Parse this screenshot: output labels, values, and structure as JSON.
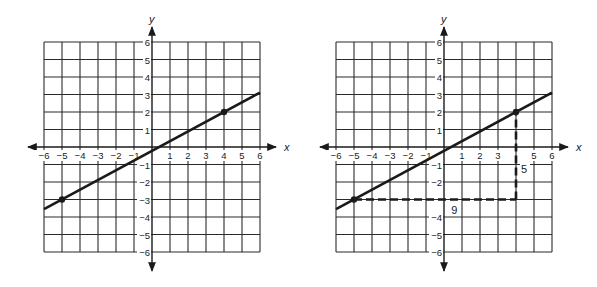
{
  "chart_data": [
    {
      "type": "line",
      "title": "",
      "xlabel": "x",
      "ylabel": "y",
      "xlim": [
        -6,
        6
      ],
      "ylim": [
        -6,
        6
      ],
      "grid": true,
      "x_ticks": [
        "-6",
        "-5",
        "-4",
        "-3",
        "-2",
        "-1",
        "1",
        "2",
        "3",
        "4",
        "5",
        "6"
      ],
      "y_ticks": [
        "6",
        "5",
        "4",
        "3",
        "2",
        "1",
        "-1",
        "-2",
        "-3",
        "-4",
        "-5",
        "-6"
      ],
      "series": [
        {
          "name": "line",
          "x": [
            -6,
            6
          ],
          "y": [
            -3.556,
            3.111
          ]
        }
      ],
      "points": [
        {
          "x": -5,
          "y": -3
        },
        {
          "x": 4,
          "y": 2
        }
      ],
      "slope": "5/9"
    },
    {
      "type": "line",
      "title": "",
      "xlabel": "x",
      "ylabel": "y",
      "xlim": [
        -6,
        6
      ],
      "ylim": [
        -6,
        6
      ],
      "grid": true,
      "x_ticks": [
        "-6",
        "-5",
        "-4",
        "-3",
        "-2",
        "-1",
        "1",
        "2",
        "3",
        "",
        "5",
        "6"
      ],
      "y_ticks": [
        "6",
        "5",
        "4",
        "3",
        "2",
        "1",
        "-1",
        "-2",
        "",
        "-4",
        "-5",
        "-6"
      ],
      "series": [
        {
          "name": "line",
          "x": [
            -6,
            6
          ],
          "y": [
            -3.556,
            3.111
          ]
        }
      ],
      "points": [
        {
          "x": -5,
          "y": -3
        },
        {
          "x": 4,
          "y": 2
        }
      ],
      "dashed_segments": [
        {
          "from": [
            -5,
            -3
          ],
          "to": [
            4,
            -3
          ],
          "label": "9"
        },
        {
          "from": [
            4,
            -3
          ],
          "to": [
            4,
            2
          ],
          "label": "5"
        }
      ]
    }
  ],
  "graphs": {
    "left": {
      "x_label": "x",
      "y_label": "y"
    },
    "right": {
      "x_label": "x",
      "y_label": "y",
      "run_label": "9",
      "rise_label": "5"
    }
  },
  "colors": {
    "ink": "#1a1a1a",
    "grid": "#2a2a2a",
    "background": "#ffffff"
  }
}
